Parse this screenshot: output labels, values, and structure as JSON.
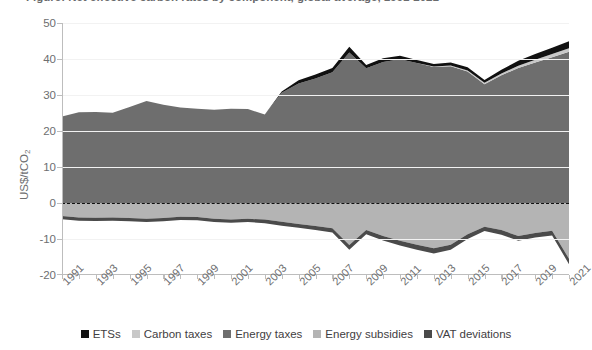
{
  "title": "Figure: Net effective carbon rates by component, global average, 1991-2021",
  "axis": {
    "y_title_main": "US$/tCO",
    "y_title_sub": "2",
    "y_ticks": [
      "50",
      "40",
      "30",
      "20",
      "10",
      "0",
      "-10",
      "-20"
    ]
  },
  "legend": {
    "items": [
      {
        "label": "ETSs",
        "color": "#111111",
        "swatch_name": "legend-swatch-etss"
      },
      {
        "label": "Carbon taxes",
        "color": "#c8c8c8",
        "swatch_name": "legend-swatch-carbon-taxes"
      },
      {
        "label": "Energy taxes",
        "color": "#6e6e6e",
        "swatch_name": "legend-swatch-energy-taxes"
      },
      {
        "label": "Energy subsidies",
        "color": "#b4b4b4",
        "swatch_name": "legend-swatch-energy-subsidies"
      },
      {
        "label": "VAT deviations",
        "color": "#4a4a4a",
        "swatch_name": "legend-swatch-vat-deviations"
      }
    ]
  },
  "chart_data": {
    "type": "area",
    "title": "Net effective carbon rates by component, global average",
    "xlabel": "",
    "ylabel": "US$/tCO2",
    "ylim": [
      -20,
      50
    ],
    "xlim": [
      1991,
      2021
    ],
    "grid": true,
    "legend_position": "bottom",
    "stacked": true,
    "zero_reference_line": true,
    "x": [
      1991,
      1992,
      1993,
      1994,
      1995,
      1996,
      1997,
      1998,
      1999,
      2000,
      2001,
      2002,
      2003,
      2004,
      2005,
      2006,
      2007,
      2008,
      2009,
      2010,
      2011,
      2012,
      2013,
      2014,
      2015,
      2016,
      2017,
      2018,
      2019,
      2020,
      2021
    ],
    "xtick_labels": [
      "1991",
      "1993",
      "1995",
      "1997",
      "1999",
      "2001",
      "2003",
      "2005",
      "2007",
      "2009",
      "2011",
      "2013",
      "2015",
      "2017",
      "2019",
      "2021"
    ],
    "series": [
      {
        "name": "Energy taxes",
        "color": "#6e6e6e",
        "sign": "positive",
        "values": [
          24.0,
          25.2,
          25.3,
          25.1,
          26.7,
          28.3,
          27.3,
          26.5,
          26.2,
          25.9,
          26.2,
          26.1,
          24.6,
          30.6,
          33.2,
          34.6,
          36.3,
          41.8,
          37.4,
          39.2,
          39.9,
          38.9,
          37.8,
          38.0,
          36.5,
          33.0,
          35.5,
          37.5,
          39.0,
          40.5,
          42.0
        ]
      },
      {
        "name": "Carbon taxes",
        "color": "#c8c8c8",
        "sign": "positive",
        "values": [
          0.0,
          0.0,
          0.0,
          0.0,
          0.0,
          0.0,
          0.0,
          0.0,
          0.0,
          0.0,
          0.0,
          0.0,
          0.0,
          0.0,
          0.0,
          0.0,
          0.0,
          0.0,
          0.0,
          0.0,
          0.0,
          0.0,
          0.1,
          0.2,
          0.3,
          0.4,
          0.5,
          0.6,
          0.8,
          0.9,
          1.0
        ]
      },
      {
        "name": "ETSs",
        "color": "#111111",
        "sign": "positive",
        "values": [
          0.0,
          0.0,
          0.0,
          0.0,
          0.0,
          0.0,
          0.0,
          0.0,
          0.0,
          0.0,
          0.0,
          0.0,
          0.0,
          0.4,
          0.9,
          1.1,
          1.2,
          1.6,
          0.9,
          1.0,
          1.0,
          0.8,
          0.7,
          0.8,
          0.9,
          0.8,
          1.0,
          1.4,
          1.6,
          1.7,
          1.9
        ]
      },
      {
        "name": "Energy subsidies",
        "color": "#b4b4b4",
        "sign": "negative",
        "values": [
          -3.6,
          -4.0,
          -4.1,
          -4.0,
          -4.2,
          -4.4,
          -4.2,
          -3.8,
          -3.9,
          -4.4,
          -4.6,
          -4.4,
          -4.6,
          -5.2,
          -5.8,
          -6.4,
          -7.0,
          -11.7,
          -7.5,
          -9.2,
          -10.5,
          -11.6,
          -12.6,
          -11.6,
          -8.7,
          -6.6,
          -7.5,
          -9.2,
          -8.3,
          -7.7,
          -15.5
        ]
      },
      {
        "name": "VAT deviations",
        "color": "#4a4a4a",
        "sign": "negative",
        "values": [
          -0.9,
          -0.9,
          -0.9,
          -0.9,
          -0.9,
          -0.9,
          -0.9,
          -0.9,
          -0.9,
          -0.9,
          -0.9,
          -0.9,
          -1.0,
          -1.1,
          -1.1,
          -1.1,
          -1.2,
          -1.3,
          -1.2,
          -1.2,
          -1.3,
          -1.4,
          -1.4,
          -1.4,
          -1.3,
          -1.2,
          -1.3,
          -1.3,
          -1.3,
          -1.3,
          -1.5
        ]
      }
    ]
  }
}
